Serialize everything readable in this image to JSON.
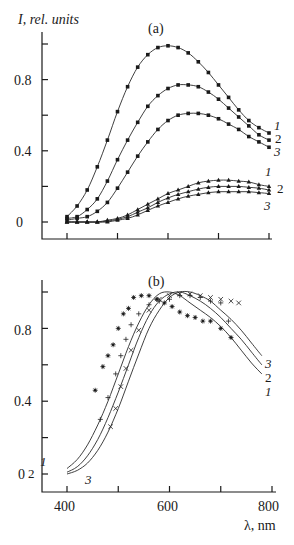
{
  "chart_data": [
    {
      "panel": "(a)",
      "type": "line",
      "title": "(a)",
      "xlabel": "",
      "ylabel": "I, rel. units",
      "xlim": [
        400,
        800
      ],
      "ylim": [
        0,
        1.0
      ],
      "xticks": [
        400,
        500,
        600,
        700,
        800
      ],
      "xtick_labels": [
        "",
        "",
        "",
        "",
        ""
      ],
      "yticks": [
        0,
        0.2,
        0.4,
        0.6,
        0.8,
        1.0
      ],
      "ytick_labels": [
        "0",
        "",
        "0.4",
        "",
        "0.8",
        ""
      ],
      "grid": false,
      "legend": "curve numbers at right end",
      "x": [
        400,
        420,
        440,
        460,
        480,
        500,
        520,
        540,
        560,
        580,
        600,
        620,
        640,
        660,
        680,
        700,
        720,
        740,
        760,
        780,
        800
      ],
      "series": [
        {
          "name": "1",
          "marker": "square",
          "values": [
            0.03,
            0.09,
            0.18,
            0.31,
            0.46,
            0.62,
            0.76,
            0.87,
            0.94,
            0.98,
            0.99,
            0.98,
            0.95,
            0.9,
            0.84,
            0.77,
            0.7,
            0.63,
            0.57,
            0.53,
            0.5
          ]
        },
        {
          "name": "2",
          "marker": "square",
          "values": [
            0.02,
            0.03,
            0.07,
            0.13,
            0.23,
            0.35,
            0.46,
            0.56,
            0.65,
            0.71,
            0.75,
            0.77,
            0.77,
            0.76,
            0.73,
            0.69,
            0.64,
            0.59,
            0.54,
            0.49,
            0.46
          ]
        },
        {
          "name": "3",
          "marker": "square",
          "values": [
            0.01,
            0.02,
            0.03,
            0.06,
            0.11,
            0.19,
            0.28,
            0.37,
            0.45,
            0.52,
            0.57,
            0.6,
            0.61,
            0.61,
            0.6,
            0.58,
            0.55,
            0.52,
            0.48,
            0.45,
            0.42
          ]
        },
        {
          "name": "1",
          "marker": "triangle",
          "values": [
            0.0,
            0.0,
            0.0,
            0.0,
            0.01,
            0.02,
            0.04,
            0.07,
            0.1,
            0.13,
            0.16,
            0.18,
            0.2,
            0.22,
            0.23,
            0.235,
            0.235,
            0.23,
            0.225,
            0.21,
            0.2
          ]
        },
        {
          "name": "2",
          "marker": "triangle",
          "values": [
            0.0,
            0.0,
            0.0,
            0.0,
            0.005,
            0.015,
            0.03,
            0.055,
            0.08,
            0.11,
            0.135,
            0.155,
            0.17,
            0.185,
            0.195,
            0.2,
            0.2,
            0.2,
            0.195,
            0.19,
            0.18
          ]
        },
        {
          "name": "3",
          "marker": "triangle",
          "values": [
            0.0,
            0.0,
            0.0,
            0.0,
            0.0,
            0.01,
            0.02,
            0.04,
            0.065,
            0.09,
            0.11,
            0.13,
            0.145,
            0.155,
            0.165,
            0.17,
            0.17,
            0.17,
            0.17,
            0.165,
            0.16
          ]
        }
      ]
    },
    {
      "panel": "(b)",
      "type": "line",
      "title": "(b)",
      "xlabel": "λ, nm",
      "ylabel": "",
      "xlim": [
        400,
        800
      ],
      "ylim": [
        0,
        1.0
      ],
      "xticks": [
        400,
        500,
        600,
        700,
        800
      ],
      "xtick_labels": [
        "400",
        "",
        "600",
        "",
        "800"
      ],
      "yticks": [
        0,
        0.2,
        0.4,
        0.6,
        0.8,
        1.0
      ],
      "ytick_labels": [
        "0",
        "",
        "0.4",
        "",
        "0.8",
        ""
      ],
      "grid": false,
      "legend": "curve numbers at ends",
      "x": [
        400,
        420,
        440,
        460,
        480,
        500,
        520,
        540,
        560,
        580,
        600,
        620,
        640,
        660,
        680,
        700,
        720,
        740,
        760,
        780
      ],
      "series": [
        {
          "name": "1",
          "values": [
            0.03,
            0.08,
            0.16,
            0.27,
            0.4,
            0.55,
            0.7,
            0.83,
            0.93,
            0.99,
            1.0,
            0.98,
            0.94,
            0.9,
            0.86,
            0.81,
            0.75,
            0.68,
            0.61,
            0.55
          ]
        },
        {
          "name": "2",
          "values": [
            0.01,
            0.04,
            0.1,
            0.19,
            0.31,
            0.45,
            0.6,
            0.75,
            0.87,
            0.95,
            0.99,
            1.0,
            0.98,
            0.95,
            0.91,
            0.86,
            0.8,
            0.74,
            0.67,
            0.6
          ]
        },
        {
          "name": "3",
          "values": [
            0.0,
            0.02,
            0.06,
            0.13,
            0.23,
            0.36,
            0.51,
            0.66,
            0.8,
            0.9,
            0.97,
            1.0,
            1.0,
            0.98,
            0.95,
            0.9,
            0.85,
            0.79,
            0.72,
            0.65
          ]
        }
      ],
      "scatter": [
        {
          "name": "1",
          "marker": "asterisk",
          "x": [
            455,
            470,
            480,
            490,
            500,
            510,
            520,
            530,
            545,
            560,
            575,
            590,
            605,
            620,
            635,
            650,
            665,
            680,
            700,
            720
          ],
          "y": [
            0.46,
            0.59,
            0.65,
            0.71,
            0.8,
            0.88,
            0.91,
            0.97,
            0.98,
            0.98,
            0.96,
            0.94,
            0.92,
            0.89,
            0.87,
            0.86,
            0.84,
            0.84,
            0.8,
            0.75
          ]
        },
        {
          "name": "2",
          "marker": "plus",
          "x": [
            465,
            480,
            495,
            505,
            515,
            525,
            540,
            560,
            580,
            600,
            620,
            640,
            660,
            680,
            700,
            715
          ],
          "y": [
            0.3,
            0.42,
            0.55,
            0.65,
            0.74,
            0.82,
            0.88,
            0.93,
            0.95,
            0.96,
            0.98,
            0.98,
            0.97,
            0.95,
            0.94,
            0.84
          ]
        },
        {
          "name": "3",
          "marker": "x",
          "x": [
            485,
            495,
            505,
            515,
            525,
            540,
            560,
            580,
            600,
            620,
            640,
            660,
            680,
            700,
            720,
            735
          ],
          "y": [
            0.26,
            0.36,
            0.48,
            0.58,
            0.68,
            0.79,
            0.9,
            0.96,
            0.98,
            0.99,
            0.99,
            0.98,
            0.97,
            0.96,
            0.95,
            0.94
          ]
        }
      ]
    }
  ],
  "labels": {
    "ylabel": "I, rel. units",
    "panel_a": "(a)",
    "panel_b": "(b)",
    "xlabel": "λ, nm",
    "a_ytick_0": "0",
    "a_ytick_04": "0.4",
    "a_ytick_08": "0.8",
    "b_ytick_0": "0",
    "b_ytick_04": "0.4",
    "b_ytick_08": "0.8",
    "b_xtick_400": "400",
    "b_xtick_600": "600",
    "b_xtick_800": "800",
    "curve_1": "1",
    "curve_2": "2",
    "curve_3": "3"
  }
}
